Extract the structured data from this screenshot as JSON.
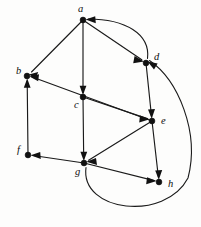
{
  "figure": {
    "type": "directed-graph",
    "width": 201,
    "height": 227,
    "background_color": "#fdfdfc",
    "stroke_color": "#1a1a1a",
    "node_color": "#111111",
    "label_color": "#0d0d0d"
  },
  "nodes": [
    {
      "id": "a",
      "label": "a",
      "x": 83,
      "y": 20,
      "label_x": 78,
      "label_y": 12
    },
    {
      "id": "b",
      "label": "b",
      "x": 27,
      "y": 76,
      "label_x": 16,
      "label_y": 74
    },
    {
      "id": "c",
      "label": "c",
      "x": 83,
      "y": 97,
      "label_x": 74,
      "label_y": 108
    },
    {
      "id": "d",
      "label": "d",
      "x": 146,
      "y": 63,
      "label_x": 154,
      "label_y": 60
    },
    {
      "id": "e",
      "label": "e",
      "x": 152,
      "y": 121,
      "label_x": 161,
      "label_y": 124
    },
    {
      "id": "f",
      "label": "f",
      "x": 28,
      "y": 155,
      "label_x": 17,
      "label_y": 153
    },
    {
      "id": "g",
      "label": "g",
      "x": 84,
      "y": 163,
      "label_x": 75,
      "label_y": 175
    },
    {
      "id": "h",
      "label": "h",
      "x": 159,
      "y": 182,
      "label_x": 168,
      "label_y": 187
    }
  ],
  "edges": [
    {
      "id": "a-b",
      "from": "a",
      "to": "b",
      "shape": "straight",
      "arrow_at": "b"
    },
    {
      "id": "a-d",
      "from": "a",
      "to": "d",
      "shape": "straight",
      "arrow_at": "d"
    },
    {
      "id": "a-c",
      "from": "a",
      "to": "c",
      "shape": "straight",
      "arrow_at": "c"
    },
    {
      "id": "c-g",
      "from": "c",
      "to": "g",
      "shape": "straight",
      "arrow_at": "g"
    },
    {
      "id": "c-e",
      "from": "c",
      "to": "e",
      "shape": "straight",
      "arrow_at": "e"
    },
    {
      "id": "e-b",
      "from": "e",
      "to": "b",
      "shape": "straight",
      "arrow_at": "b"
    },
    {
      "id": "d-e",
      "from": "d",
      "to": "e",
      "shape": "straight",
      "arrow_at": "e"
    },
    {
      "id": "e-h",
      "from": "e",
      "to": "h",
      "shape": "straight",
      "arrow_at": "h"
    },
    {
      "id": "e-g",
      "from": "e",
      "to": "g",
      "shape": "straight",
      "arrow_at": "g"
    },
    {
      "id": "g-f",
      "from": "g",
      "to": "f",
      "shape": "straight",
      "arrow_at": "f"
    },
    {
      "id": "f-b",
      "from": "f",
      "to": "b",
      "shape": "straight",
      "arrow_at": "b"
    },
    {
      "id": "g-h",
      "from": "g",
      "to": "h",
      "shape": "straight",
      "arrow_at": "h"
    },
    {
      "id": "d-a",
      "from": "d",
      "to": "a",
      "shape": "curved",
      "arrow_at": "a",
      "curve_side": "top"
    },
    {
      "id": "g-d",
      "from": "g",
      "to": "d",
      "shape": "curved",
      "arrow_at": "d",
      "curve_side": "bottom-right"
    }
  ],
  "node_count": 8,
  "edge_count": 14
}
